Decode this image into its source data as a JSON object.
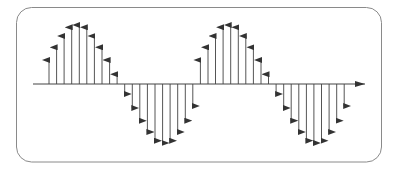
{
  "diagram": {
    "colors": {
      "frame": "#8a8a8a",
      "axis": "#444444",
      "stem": "#555555",
      "background": "#ffffff"
    },
    "frame": {
      "x": 16.5,
      "y": 7.5,
      "width": 365,
      "height": 154.5,
      "radius": 15
    },
    "axis": {
      "x_start": 33,
      "x_end": 365,
      "y": 84
    },
    "samples": {
      "x_start": 49,
      "step": 7.57,
      "periods": 2,
      "period_values": [
        24,
        36.7,
        48,
        56.7,
        59,
        56.7,
        48,
        36.7,
        24,
        9.7,
        -10,
        -24,
        -36.7,
        -48,
        -56.7,
        -59,
        -56.7,
        -48,
        -36.7,
        -22
      ]
    }
  }
}
